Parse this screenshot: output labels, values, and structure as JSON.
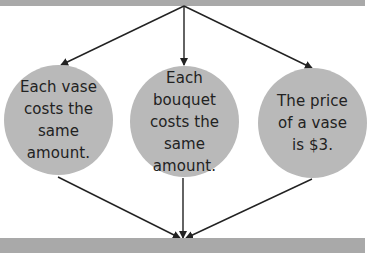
{
  "diagram": {
    "type": "flow",
    "colors": {
      "bar": "#a9a9a9",
      "node_fill": "#b9b9b9",
      "text": "#222222",
      "arrow": "#222222"
    },
    "top_bar": {
      "text": ""
    },
    "bottom_bar": {
      "text": ""
    },
    "nodes": [
      {
        "id": "vase-same",
        "label": "Each vase costs the same amount."
      },
      {
        "id": "bouquet-same",
        "label": "Each bouquet costs the same amount."
      },
      {
        "id": "vase-price",
        "label": "The price of a vase is $3."
      }
    ],
    "edges": [
      {
        "from": "top_bar",
        "to": "vase-same"
      },
      {
        "from": "top_bar",
        "to": "bouquet-same"
      },
      {
        "from": "top_bar",
        "to": "vase-price"
      },
      {
        "from": "vase-same",
        "to": "bottom_bar"
      },
      {
        "from": "bouquet-same",
        "to": "bottom_bar"
      },
      {
        "from": "vase-price",
        "to": "bottom_bar"
      }
    ]
  }
}
